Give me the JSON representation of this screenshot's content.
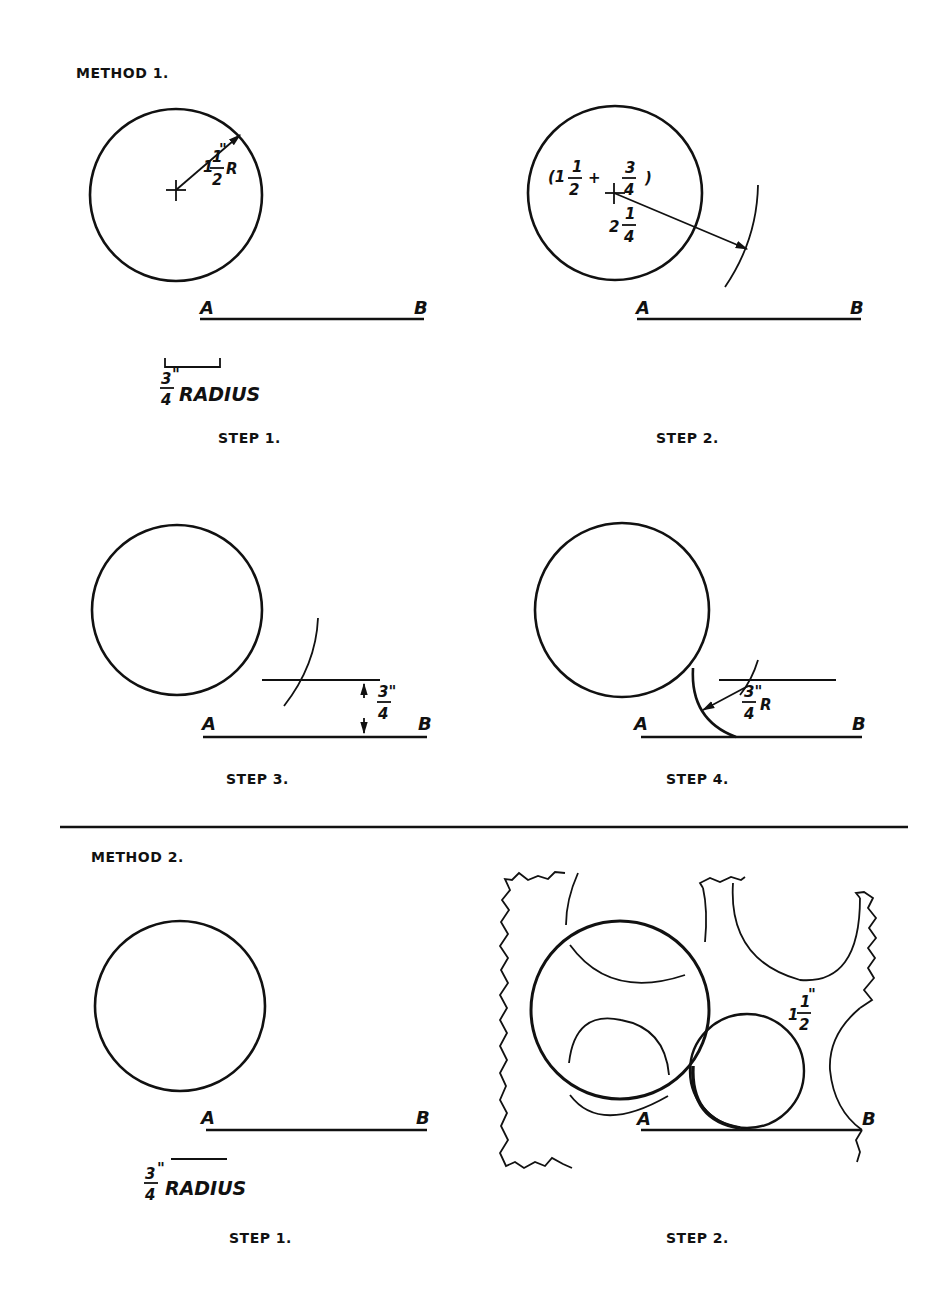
{
  "method1": {
    "title": "METHOD 1.",
    "step1": {
      "caption": "STEP 1.",
      "radius_whole": "1",
      "radius_num": "1",
      "radius_den": "2",
      "radius_unit": "\"",
      "radius_suffix": "R",
      "point_a": "A",
      "point_b": "B",
      "given_num": "3",
      "given_den": "4",
      "given_unit": "\"",
      "given_label": "RADIUS"
    },
    "step2": {
      "caption": "STEP 2.",
      "sum_open": "(1",
      "sum_num1": "1",
      "sum_den1": "2",
      "sum_plus": "+",
      "sum_num2": "3",
      "sum_den2": "4",
      "sum_close": ")",
      "total_whole": "2",
      "total_num": "1",
      "total_den": "4",
      "point_a": "A",
      "point_b": "B"
    },
    "step3": {
      "caption": "STEP 3.",
      "offset_num": "3\"",
      "offset_den": "4",
      "point_a": "A",
      "point_b": "B"
    },
    "step4": {
      "caption": "STEP 4.",
      "arc_num": "3\"",
      "arc_den": "4",
      "arc_suffix": "R",
      "point_a": "A",
      "point_b": "B"
    }
  },
  "method2": {
    "title": "METHOD 2.",
    "step1": {
      "caption": "STEP 1.",
      "point_a": "A",
      "point_b": "B",
      "given_num": "3",
      "given_den": "4",
      "given_unit": "\"",
      "given_label": "RADIUS"
    },
    "step2": {
      "caption": "STEP 2.",
      "radius_whole": "1",
      "radius_num": "1",
      "radius_den": "2",
      "radius_unit": "\"",
      "point_a": "A",
      "point_b": "B"
    }
  },
  "colors": {
    "ink": "#111111",
    "paper": "#ffffff"
  }
}
